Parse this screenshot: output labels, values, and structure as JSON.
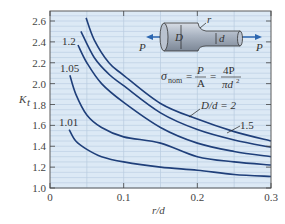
{
  "chart_data": {
    "type": "line",
    "title": "",
    "xlabel": "r/d",
    "ylabel": "K_t",
    "xlim": [
      0,
      0.3
    ],
    "ylim": [
      1.0,
      2.6
    ],
    "grid": true,
    "x_ticks": [
      "0",
      "0.1",
      "0.2",
      "0.3"
    ],
    "y_ticks": [
      "1.0",
      "1.2",
      "1.4",
      "1.6",
      "1.8",
      "2.0",
      "2.2",
      "2.4",
      "2.6"
    ],
    "series": [
      {
        "name": "D/d = 2",
        "label": "D/d = 2",
        "x": [
          0.049,
          0.06,
          0.08,
          0.1,
          0.15,
          0.2,
          0.25,
          0.3
        ],
        "y": [
          2.63,
          2.42,
          2.2,
          2.08,
          1.81,
          1.66,
          1.54,
          1.45
        ]
      },
      {
        "name": "1.5",
        "label": "1.5",
        "x": [
          0.042,
          0.06,
          0.08,
          0.1,
          0.15,
          0.2,
          0.25,
          0.3
        ],
        "y": [
          2.5,
          2.25,
          2.09,
          1.98,
          1.72,
          1.56,
          1.46,
          1.39
        ]
      },
      {
        "name": "1.2",
        "label": "1.2",
        "x": [
          0.038,
          0.05,
          0.07,
          0.1,
          0.15,
          0.2,
          0.25,
          0.3
        ],
        "y": [
          2.37,
          2.2,
          2.0,
          1.82,
          1.58,
          1.43,
          1.35,
          1.3
        ]
      },
      {
        "name": "1.05",
        "label": "1.05",
        "x": [
          0.027,
          0.035,
          0.05,
          0.07,
          0.1,
          0.15,
          0.2,
          0.25,
          0.3
        ],
        "y": [
          2.08,
          1.9,
          1.7,
          1.58,
          1.49,
          1.43,
          1.3,
          1.25,
          1.22
        ]
      },
      {
        "name": "1.01",
        "label": "1.01",
        "x": [
          0.026,
          0.035,
          0.05,
          0.07,
          0.1,
          0.15,
          0.2,
          0.25,
          0.3
        ],
        "y": [
          1.56,
          1.45,
          1.37,
          1.3,
          1.25,
          1.2,
          1.17,
          1.13,
          1.11
        ]
      }
    ],
    "annotations": [
      {
        "text": "σ_nom = P/A = 4P/(πd²)"
      },
      {
        "text": "Inset: stepped round bar with diameters D and d, fillet radius r, axial load P"
      }
    ]
  },
  "axes": {
    "x_label": "r/d",
    "y_label": "K",
    "y_label_sub": "t"
  },
  "inset": {
    "D": "D",
    "d": "d",
    "r": "r",
    "P_left": "P",
    "P_right": "P",
    "formula": {
      "sigma": "σ",
      "sub": "nom",
      "eq1": "=",
      "num1": "P",
      "den1": "A",
      "eq2": "=",
      "num2": "4P",
      "den2": "πd",
      "den2_sup": "2"
    }
  },
  "colors": {
    "plot_bg": "#dce9f5",
    "grid": "#b7cbe0",
    "curve": "#1f3f7a",
    "frame": "#5a5a5a",
    "arrow": "#2c66b0"
  }
}
